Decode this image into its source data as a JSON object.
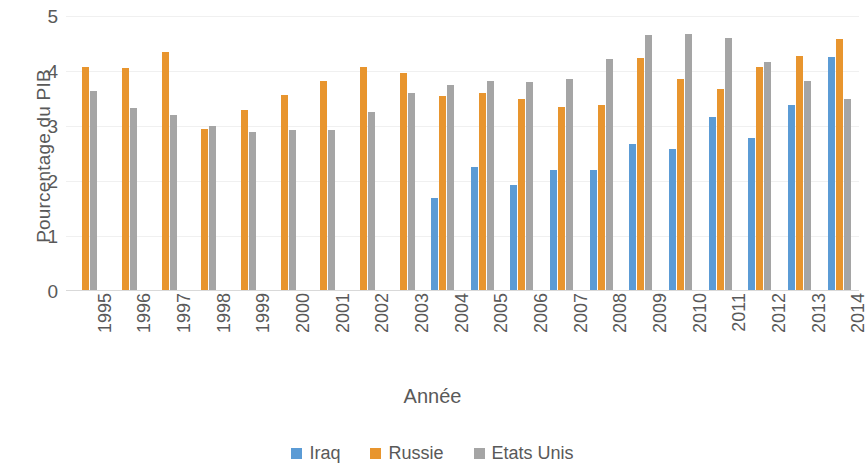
{
  "chart_data": {
    "type": "bar",
    "title": "",
    "xlabel": "Année",
    "ylabel": "Pourcentage du PIB",
    "ylim": [
      0,
      5
    ],
    "yticks": [
      0,
      1,
      2,
      3,
      4,
      5
    ],
    "grid": true,
    "legend_position": "bottom",
    "categories": [
      "1995",
      "1996",
      "1997",
      "1998",
      "1999",
      "2000",
      "2001",
      "2002",
      "2003",
      "2004",
      "2005",
      "2006",
      "2007",
      "2008",
      "2009",
      "2010",
      "2011",
      "2012",
      "2013",
      "2014"
    ],
    "series": [
      {
        "name": "Iraq",
        "color": "#5B9BD5",
        "values": [
          null,
          null,
          null,
          null,
          null,
          null,
          null,
          null,
          null,
          1.7,
          2.25,
          1.92,
          2.2,
          2.2,
          2.67,
          2.58,
          3.17,
          2.78,
          3.38,
          4.25
        ]
      },
      {
        "name": "Russie",
        "color": "#E8952E",
        "values": [
          4.07,
          4.05,
          4.35,
          2.95,
          3.3,
          3.57,
          3.82,
          4.07,
          3.97,
          3.55,
          3.6,
          3.5,
          3.35,
          3.38,
          4.23,
          3.85,
          3.68,
          4.07,
          4.27,
          4.58
        ]
      },
      {
        "name": "Etats Unis",
        "color": "#A5A5A5",
        "values": [
          3.63,
          3.33,
          3.2,
          3.0,
          2.9,
          2.93,
          2.93,
          3.25,
          3.6,
          3.75,
          3.82,
          3.8,
          3.85,
          4.22,
          4.65,
          4.67,
          4.6,
          4.17,
          3.82,
          3.5
        ]
      }
    ]
  },
  "axis": {
    "y_title": "Pourcentage du PIB",
    "x_title": "Année",
    "y_tick_labels": [
      "5",
      "4",
      "3",
      "2",
      "1",
      "0"
    ]
  },
  "legend": {
    "items": [
      {
        "label": "Iraq",
        "color": "#5B9BD5"
      },
      {
        "label": "Russie",
        "color": "#E8952E"
      },
      {
        "label": "Etats Unis",
        "color": "#A5A5A5"
      }
    ]
  }
}
